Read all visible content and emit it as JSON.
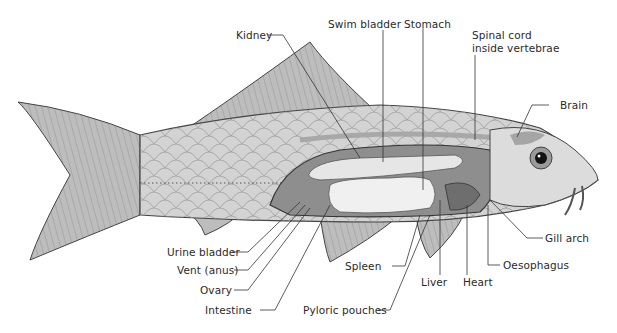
{
  "diagram": {
    "labels": {
      "kidney": "Kidney",
      "swim_bladder": "Swim bladder",
      "stomach": "Stomach",
      "spinal_cord_line1": "Spinal cord",
      "spinal_cord_line2": "inside vertebrae",
      "brain": "Brain",
      "gill_arch": "Gill arch",
      "oesophagus": "Oesophagus",
      "heart": "Heart",
      "liver": "Liver",
      "spleen": "Spleen",
      "pyloric_pouches": "Pyloric pouches",
      "urine_bladder": "Urine bladder",
      "vent": "Vent (anus)",
      "ovary": "Ovary",
      "intestine": "Intestine"
    },
    "colors": {
      "body": "#cfcfcf",
      "fin": "#b9b9b9",
      "organ_dark": "#8a8a8a",
      "organ_light": "#ececec",
      "line": "#333333"
    }
  }
}
